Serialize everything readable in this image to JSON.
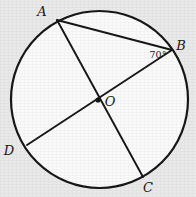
{
  "figure": {
    "kind": "circle-geometry-diagram",
    "background_color": "#e9e9e9",
    "circle_fill_color": "#fafafa",
    "stroke_color": "#141414",
    "circle": {
      "center_label": "O",
      "center_x": 99.5,
      "center_y": 99.5,
      "radius": 88.5,
      "stroke_width": 2.2
    },
    "center_dot": {
      "x": 98,
      "y": 100,
      "radius": 2.6
    },
    "points": [
      {
        "name": "A",
        "x": 57,
        "y": 20,
        "label": "A",
        "label_x": 42,
        "label_y": 16
      },
      {
        "name": "B",
        "x": 172,
        "y": 50,
        "label": "B",
        "label_x": 181,
        "label_y": 50
      },
      {
        "name": "C",
        "x": 143,
        "y": 177,
        "label": "C",
        "label_x": 148,
        "label_y": 192
      },
      {
        "name": "D",
        "x": 27,
        "y": 145,
        "label": "D",
        "label_x": 9,
        "label_y": 155
      }
    ],
    "segments": [
      {
        "name": "chord-AB",
        "from": "A",
        "to": "B",
        "x1": 57,
        "y1": 20,
        "x2": 172,
        "y2": 50,
        "stroke_width": 1.9
      },
      {
        "name": "diameter-AC",
        "from": "A",
        "to": "C",
        "x1": 57,
        "y1": 20,
        "x2": 143,
        "y2": 177,
        "stroke_width": 1.9
      },
      {
        "name": "diameter-BD",
        "from": "B",
        "to": "D",
        "x1": 172,
        "y1": 50,
        "x2": 27,
        "y2": 145,
        "stroke_width": 1.9
      }
    ],
    "angle_marks": [
      {
        "name": "angle-ABD",
        "vertex": "B",
        "value": "70°",
        "label_x": 158,
        "label_y": 58
      }
    ]
  }
}
